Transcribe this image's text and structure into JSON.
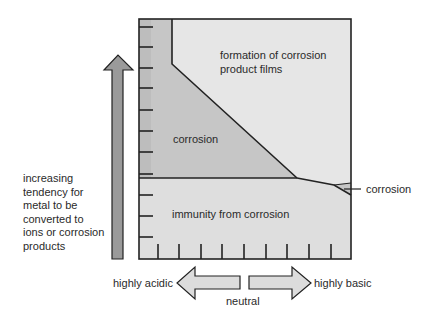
{
  "diagram": {
    "type": "corrosion-potential-ph-diagram",
    "regions": {
      "films": "formation of corrosion product films",
      "films_line1": "formation of corrosion",
      "films_line2": "product films",
      "corrosion": "corrosion",
      "immunity": "immunity from corrosion",
      "corrosion_right": "corrosion"
    },
    "y_axis": {
      "lines": [
        "increasing",
        "tendency for",
        "metal to be",
        "converted to",
        "ions or corrosion",
        "products"
      ]
    },
    "x_axis": {
      "left": "highly acidic",
      "center": "neutral",
      "right": "highly basic"
    },
    "colors": {
      "corrosion": "#c6c6c6",
      "films": "#e6e6e6",
      "immunity": "#dedede",
      "arrow": "#9a9a9a",
      "line": "#222222"
    }
  }
}
